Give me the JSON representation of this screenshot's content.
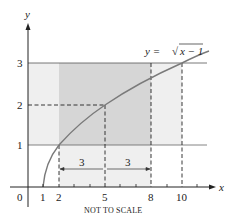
{
  "diagram": {
    "function_label": "y = √x − 1",
    "function_label_parts": {
      "lhs": "y = ",
      "radical": "√",
      "radicand": "x − 1"
    },
    "axis_labels": {
      "x": "x",
      "y": "y"
    },
    "origin_label": "0",
    "x_ticks": [
      "1",
      "2",
      "5",
      "8",
      "10"
    ],
    "y_ticks": [
      "1",
      "2",
      "3"
    ],
    "interval_labels": [
      "3",
      "3"
    ],
    "footnote": "NOT TO SCALE",
    "colors": {
      "light_band": "#efefef",
      "dark_band": "#d6d6d6",
      "curve": "#7a7a7a",
      "lines": "#444444"
    }
  }
}
